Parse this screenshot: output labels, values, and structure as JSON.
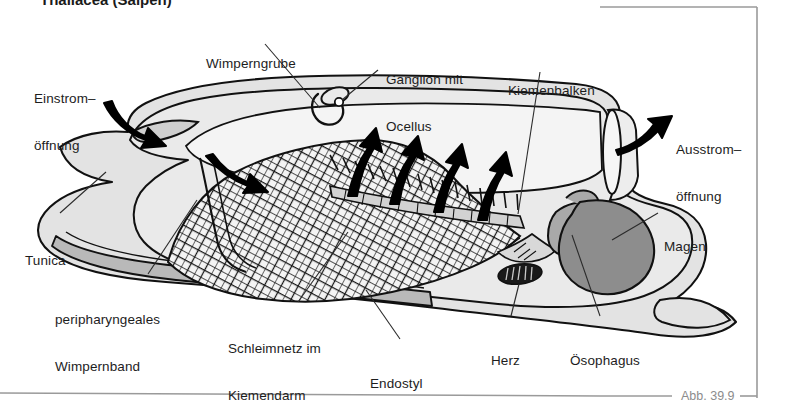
{
  "figure": {
    "title_partial": "Thaliacea (Salpen)",
    "caption": "Abb. 39.9"
  },
  "labels": [
    {
      "id": "einstromoeffnung",
      "line1": "Einstrom–",
      "line2": "öffnung",
      "x": 34,
      "y": 60
    },
    {
      "id": "wimperngrube",
      "line1": "Wimperngrube",
      "line2": "",
      "x": 206,
      "y": 25
    },
    {
      "id": "ganglion",
      "line1": "Ganglion mit",
      "line2": "Ocellus",
      "x": 386,
      "y": 41
    },
    {
      "id": "kiemenbalken",
      "line1": "Kiemenbalken",
      "line2": "",
      "x": 508,
      "y": 52
    },
    {
      "id": "ausstromoeffnung",
      "line1": "Ausstrom–",
      "line2": "öffnung",
      "x": 676,
      "y": 111
    },
    {
      "id": "magen",
      "line1": "Magen",
      "line2": "",
      "x": 664,
      "y": 208
    },
    {
      "id": "tunica",
      "line1": "Tunica",
      "line2": "",
      "x": 25,
      "y": 222
    },
    {
      "id": "wimpernband",
      "line1": "peripharyngeales",
      "line2": "Wimpernband",
      "x": 55,
      "y": 281
    },
    {
      "id": "schleimnetz",
      "line1": "Schleimnetz im",
      "line2": "Kiemendarm",
      "x": 228,
      "y": 310
    },
    {
      "id": "endostyl",
      "line1": "Endostyl",
      "line2": "",
      "x": 370,
      "y": 345
    },
    {
      "id": "herz",
      "line1": "Herz",
      "line2": "",
      "x": 491,
      "y": 322
    },
    {
      "id": "oesophagus",
      "line1": "Ösophagus",
      "line2": "",
      "x": 570,
      "y": 322
    }
  ],
  "anatomy": {
    "tunica_label": "Tunica (outer test)",
    "mantle_label": "body wall mantle",
    "pharynx_label": "branchial basket",
    "mucous_net_label": "Schleimnetz mesh",
    "stomach_label": "Magen",
    "heart_label": "Herz",
    "endostyle_label": "Endostyl",
    "ganglion_label": "Ganglion mit Ocellus",
    "ciliated_pit_label": "Wimperngrube",
    "inflow_arrow_label": "inflow current arrow",
    "outflow_arrow_label": "outflow current arrow",
    "internal_arrow_label": "internal water current arrow",
    "gillbar_label": "Kiemenbalken hatching"
  },
  "colors": {
    "tunica_fill": "#e3e3e3",
    "body_fill": "#eaeaea",
    "pharynx_fill": "#f2f2f2",
    "endostyle_fill": "#b9b9b9",
    "stomach_fill": "#8d8d8d",
    "esophagus_fill": "#a9a9a9",
    "heart_fill": "#1a1a1a",
    "outline": "#111111",
    "arrow": "#000000",
    "leader": "#2b2b2b",
    "frame": "#9a9a9a",
    "caption_text": "#8c8c8c"
  },
  "frame": {
    "top_rule_label": "top border rule",
    "right_rule_label": "right border rule",
    "bottom_rule_label": "bottom border rule"
  }
}
